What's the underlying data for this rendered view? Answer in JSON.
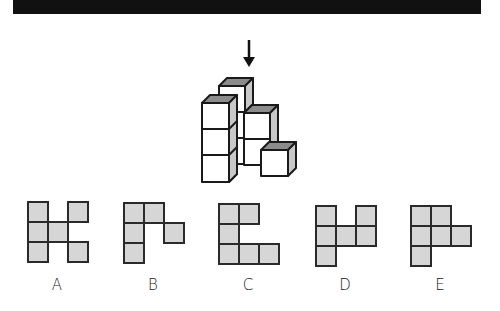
{
  "header": {
    "bar_color": "#111111"
  },
  "question": {
    "arrow": {
      "icon": "down-arrow-icon",
      "direction": "down",
      "x": 249,
      "y_start": 40,
      "y_end": 66
    },
    "figure": {
      "description": "3D arrangement of unit cubes viewed from top (arrow)",
      "top_face_color": "#8c8c8c",
      "side_face_color": "#c8c8c8",
      "front_face_color": "#ffffff"
    }
  },
  "options": [
    {
      "label": "A",
      "x": 27,
      "y": 201,
      "cells": [
        [
          0,
          0
        ],
        [
          2,
          0
        ],
        [
          0,
          1
        ],
        [
          1,
          1
        ],
        [
          0,
          2
        ],
        [
          2,
          2
        ]
      ]
    },
    {
      "label": "B",
      "x": 123,
      "y": 202,
      "cells": [
        [
          0,
          0
        ],
        [
          1,
          0
        ],
        [
          0,
          1
        ],
        [
          2,
          1
        ],
        [
          0,
          2
        ]
      ]
    },
    {
      "label": "C",
      "x": 218,
      "y": 203,
      "cells": [
        [
          0,
          0
        ],
        [
          1,
          0
        ],
        [
          0,
          1
        ],
        [
          0,
          2
        ],
        [
          1,
          2
        ],
        [
          2,
          2
        ]
      ]
    },
    {
      "label": "D",
      "x": 315,
      "y": 205,
      "cells": [
        [
          0,
          0
        ],
        [
          2,
          0
        ],
        [
          0,
          1
        ],
        [
          1,
          1
        ],
        [
          2,
          1
        ],
        [
          0,
          2
        ]
      ]
    },
    {
      "label": "E",
      "x": 410,
      "y": 205,
      "cells": [
        [
          0,
          0
        ],
        [
          1,
          0
        ],
        [
          0,
          1
        ],
        [
          1,
          1
        ],
        [
          2,
          1
        ],
        [
          0,
          2
        ]
      ]
    }
  ],
  "labels_y": 276,
  "colors": {
    "cell_fill": "#d6d6d6",
    "cell_border": "#2a2a2a"
  }
}
